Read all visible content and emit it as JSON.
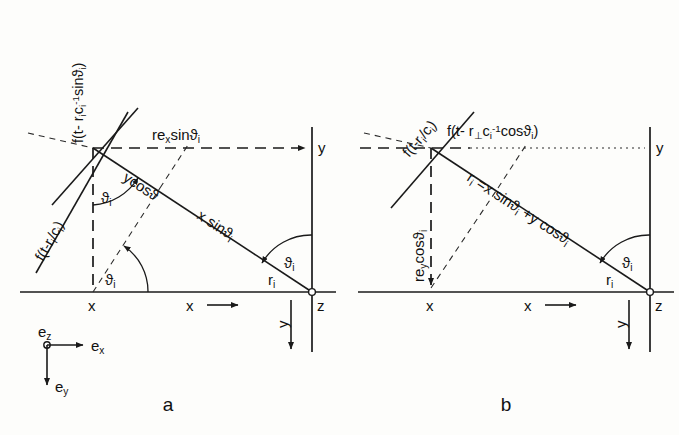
{
  "figure": {
    "caption_a": "a",
    "caption_b": "b",
    "background": "#fdfdfb",
    "ink": "#1a1a1a"
  },
  "basis_legend": {
    "e_z": "e",
    "e_z_sub": "z",
    "e_x": "e",
    "e_x_sub": "x",
    "e_y": "e",
    "e_y_sub": "y"
  },
  "panel_a": {
    "axis_x_label": "x",
    "axis_x_arrow_label": "x",
    "axis_y_label": "y",
    "point_x_label": "x",
    "point_z_label": "z",
    "vertical_y_label": "y",
    "angle_at_origin": "ϑ",
    "angle_at_origin_sub": "i",
    "angle_at_base": "ϑ",
    "angle_at_base_sub": "i",
    "angle_at_z": "ϑ",
    "angle_at_z_sub": "i",
    "r_label": "r",
    "r_label_sub": "i",
    "horizontal_dash_label": "re",
    "horizontal_dash_label_sub": "x",
    "horizontal_dash_label_rest": "sinϑ",
    "horizontal_dash_label_rest_sub": "i",
    "diag_label_1": "ycosϑ",
    "diag_label_2": "x sinϑ",
    "diag_label_2_sub": "i",
    "rot_formula_left": "f(t-r",
    "rot_formula_left_sub": "i",
    "rot_formula_left_rest": "/c",
    "rot_formula_left_rest_sub": "i",
    "rot_formula_left_end": ")",
    "rot_formula_vert": "f(t- r",
    "rot_formula_vert_sub": "i",
    "rot_formula_vert_c": "c",
    "rot_formula_vert_c_sub": "i",
    "rot_formula_vert_c_sup": "-1",
    "rot_formula_vert_rest": "sinϑ",
    "rot_formula_vert_rest_sub": "i",
    "rot_formula_vert_end": ")"
  },
  "panel_b": {
    "axis_x_label": "x",
    "axis_x_arrow_label": "x",
    "axis_y_label": "y",
    "point_x_label": "x",
    "point_z_label": "z",
    "vertical_y_label": "y",
    "angle_at_z": "ϑ",
    "angle_at_z_sub": "i",
    "r_label": "r",
    "r_label_sub": "i",
    "vertical_dash_label": "re",
    "vertical_dash_label_sub": "y",
    "vertical_dash_label_rest": "cosϑ",
    "vertical_dash_label_rest_sub": "i",
    "diag_formula": "r",
    "diag_formula_sub": "i",
    "diag_formula_rest": " =x sinϑ",
    "diag_formula_rest_sub": "i",
    "diag_formula_tail": " +y cosϑ",
    "diag_formula_tail_sub": "i",
    "rot_formula_upper": "f(t-r",
    "rot_formula_upper_sub": "i",
    "rot_formula_upper_rest": "/c",
    "rot_formula_upper_rest_sub": "i",
    "rot_formula_upper_end": ")",
    "horiz_formula": "f(t- r",
    "horiz_formula_perp": "⊥",
    "horiz_formula_c": "c",
    "horiz_formula_c_sub": "i",
    "horiz_formula_c_sup": "-1",
    "horiz_formula_rest": "cosϑ",
    "horiz_formula_rest_sub": "i",
    "horiz_formula_end": ")"
  }
}
